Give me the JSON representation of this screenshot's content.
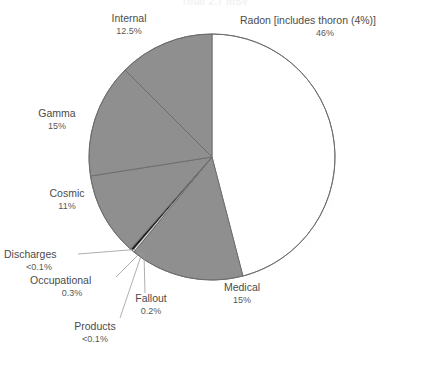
{
  "chart": {
    "title": "Total 2.7 mSv",
    "center_x": 212,
    "center_y": 157,
    "radius": 123
  },
  "chart_data": {
    "type": "pie",
    "title": "Total 2.7 mSv",
    "xlabel": "",
    "ylabel": "",
    "grid": false,
    "legend_position": "callout-labels",
    "start_angle_deg": 0,
    "direction": "clockwise",
    "categories": [
      "Radon [includes thoron (4%)]",
      "Medical",
      "Products",
      "Fallout",
      "Occupational",
      "Discharges",
      "Cosmic",
      "Gamma",
      "Internal"
    ],
    "values": [
      46,
      15,
      0.05,
      0.2,
      0.3,
      0.05,
      11,
      15,
      12.5
    ],
    "value_labels": [
      "46%",
      "15%",
      "<0.1%",
      "0.2%",
      "0.3%",
      "<0.1%",
      "11%",
      "15%",
      "12.5%"
    ],
    "slices": [
      {
        "label": "Radon [includes thoron (4%)]",
        "pct_text": "46%",
        "value": 46,
        "color": "#ffffff"
      },
      {
        "label": "Medical",
        "pct_text": "15%",
        "value": 15,
        "color": "#8f8f8f"
      },
      {
        "label": "Products",
        "pct_text": "<0.1%",
        "value": 0.05,
        "color": "#2b2b2b"
      },
      {
        "label": "Fallout",
        "pct_text": "0.2%",
        "value": 0.2,
        "color": "#ffffff"
      },
      {
        "label": "Occupational",
        "pct_text": "0.3%",
        "value": 0.3,
        "color": "#171717"
      },
      {
        "label": "Discharges",
        "pct_text": "<0.1%",
        "value": 0.05,
        "color": "#6e6e6e"
      },
      {
        "label": "Cosmic",
        "pct_text": "11%",
        "value": 11,
        "color": "#8f8f8f"
      },
      {
        "label": "Gamma",
        "pct_text": "15%",
        "value": 15,
        "color": "#8f8f8f"
      },
      {
        "label": "Internal",
        "pct_text": "12.5%",
        "value": 12.5,
        "color": "#8f8f8f"
      }
    ],
    "colors": {
      "slice_white": "#ffffff",
      "slice_gray": "#8f8f8f",
      "slice_dark": "#2b2b2b",
      "outline": "#6b6b6b",
      "shadow": "#f0f0f0",
      "label_text": "#4b4b4b",
      "leader_line": "#9a9a9a"
    }
  },
  "labels": {
    "internal": {
      "name": "Internal",
      "pct": "12.5%"
    },
    "radon": {
      "name": "Radon [includes thoron (4%)]",
      "pct": "46%"
    },
    "gamma": {
      "name": "Gamma",
      "pct": "15%"
    },
    "cosmic": {
      "name": "Cosmic",
      "pct": "11%"
    },
    "medical": {
      "name": "Medical",
      "pct": "15%"
    },
    "discharges": {
      "name": "Discharges",
      "pct": "<0.1%"
    },
    "occupational": {
      "name": "Occupational",
      "pct": "0.3%"
    },
    "fallout": {
      "name": "Fallout",
      "pct": "0.2%"
    },
    "products": {
      "name": "Products",
      "pct": "<0.1%"
    }
  }
}
